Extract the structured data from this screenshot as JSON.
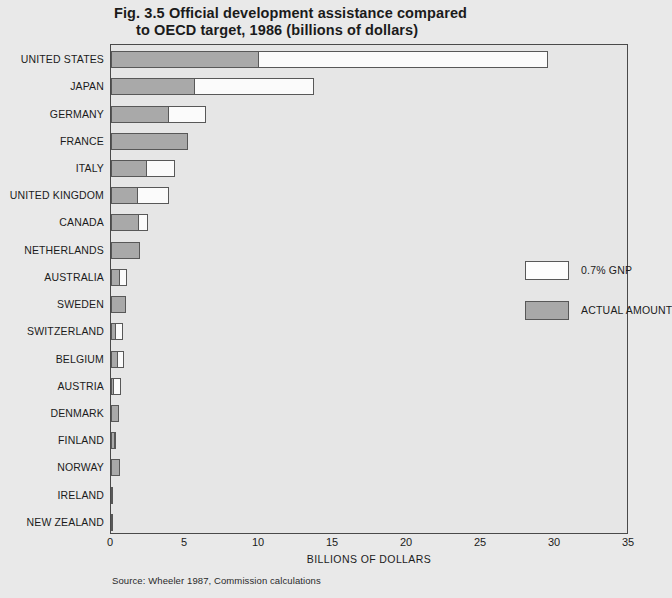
{
  "figure": {
    "title_line1": "Fig. 3.5  Official development assistance compared",
    "title_line2": "to OECD target, 1986 (billions of dollars)",
    "source": "Source: Wheeler 1987, Commission calculations"
  },
  "legend": {
    "position": "inside-right",
    "items": [
      {
        "label": "0.7% GNP",
        "swatch": "target",
        "color": "#fdfdfd"
      },
      {
        "label": "ACTUAL AMOUNT",
        "swatch": "actual",
        "color": "#a9a9a9"
      }
    ]
  },
  "chart_data": {
    "type": "bar",
    "orientation": "horizontal",
    "title": "Fig. 3.5  Official development assistance compared to OECD target, 1986 (billions of dollars)",
    "xlabel": "BILLIONS OF DOLLARS",
    "ylabel": "",
    "xlim": [
      0,
      35
    ],
    "xticks": [
      0,
      5,
      10,
      15,
      20,
      25,
      30,
      35
    ],
    "xtick_labels": [
      "0",
      "5",
      "10",
      "15",
      "20",
      "25",
      "30",
      "35"
    ],
    "grid": false,
    "legend_position": "inside-right",
    "categories": [
      "UNITED STATES",
      "JAPAN",
      "GERMANY",
      "FRANCE",
      "ITALY",
      "UNITED KINGDOM",
      "CANADA",
      "NETHERLANDS",
      "AUSTRALIA",
      "SWEDEN",
      "SWITZERLAND",
      "BELGIUM",
      "AUSTRIA",
      "DENMARK",
      "FINLAND",
      "NORWAY",
      "IRELAND",
      "NEW ZEALAND"
    ],
    "series": [
      {
        "name": "0.7% GNP",
        "values": [
          29.5,
          13.7,
          6.4,
          5.2,
          4.3,
          3.9,
          2.5,
          1.95,
          1.1,
          1.0,
          0.8,
          0.9,
          0.65,
          0.55,
          0.35,
          0.6,
          0.1,
          0.1
        ]
      },
      {
        "name": "ACTUAL AMOUNT",
        "values": [
          10.0,
          5.7,
          3.9,
          5.2,
          2.4,
          1.85,
          1.9,
          1.95,
          0.6,
          1.0,
          0.35,
          0.45,
          0.2,
          0.55,
          0.3,
          0.6,
          0.05,
          0.05
        ]
      }
    ]
  },
  "axis": {
    "x_title": "BILLIONS OF DOLLARS"
  }
}
